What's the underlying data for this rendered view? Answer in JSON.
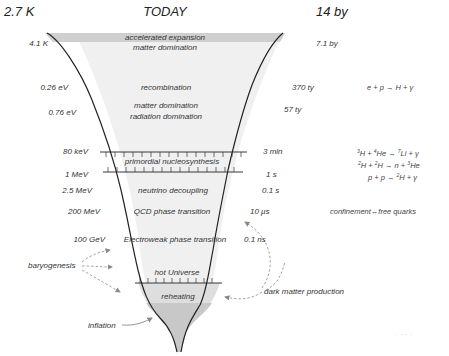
{
  "header": {
    "left_temperature": "2.7 K",
    "title": "TODAY",
    "right_age": "14 by"
  },
  "left_axis": [
    {
      "label": "4.1 K",
      "y": 44
    },
    {
      "label": "0.26 eV",
      "y": 88
    },
    {
      "label": "0.76 eV",
      "y": 113
    },
    {
      "label": "80 keV",
      "y": 152
    },
    {
      "label": "1 MeV",
      "y": 175
    },
    {
      "label": "2.5 MeV",
      "y": 191
    },
    {
      "label": "200 MeV",
      "y": 212
    },
    {
      "label": "100 GeV",
      "y": 240
    }
  ],
  "right_axis": [
    {
      "label": "7.1 by",
      "y": 44
    },
    {
      "label": "370 ty",
      "y": 88
    },
    {
      "label": "57 ty",
      "y": 110
    },
    {
      "label": "3 min",
      "y": 152
    },
    {
      "label": "1 s",
      "y": 175
    },
    {
      "label": "0.1 s",
      "y": 191
    },
    {
      "label": "10 μs",
      "y": 212
    },
    {
      "label": "0.1 ns",
      "y": 240
    }
  ],
  "epochs": [
    {
      "label": "accelerated expansion",
      "y": 38
    },
    {
      "label": "matter domination",
      "y": 48
    },
    {
      "label": "recombination",
      "y": 88
    },
    {
      "label": "matter domination",
      "y": 106
    },
    {
      "label": "radiation domination",
      "y": 117
    },
    {
      "label": "primordial nucleosynthesis",
      "y": 162
    },
    {
      "label": "neutrino decoupling",
      "y": 191
    },
    {
      "label": "QCD phase transition",
      "y": 212
    },
    {
      "label": "Electroweak phase transition",
      "y": 240
    },
    {
      "label": "hot Universe",
      "y": 273
    },
    {
      "label": "reheating",
      "y": 297
    }
  ],
  "reactions": {
    "recombination": "e + p → H + γ",
    "bbn_1": {
      "a": "3",
      "b": "H + ",
      "c": "4",
      "d": "He → ",
      "e": "7",
      "f": "Li + γ"
    },
    "bbn_2": {
      "a": "2",
      "b": "H + ",
      "c": "2",
      "d": "H → n + ",
      "e": "3",
      "f": "He"
    },
    "bbn_3": {
      "a": "p + p → ",
      "b": "2",
      "c": "H + γ"
    },
    "qcd": "confinement↔free quarks"
  },
  "annotations": {
    "baryogenesis": "baryogenesis",
    "dark_matter": "dark matter production",
    "inflation": "inflation"
  },
  "watermark": "· · · ·"
}
